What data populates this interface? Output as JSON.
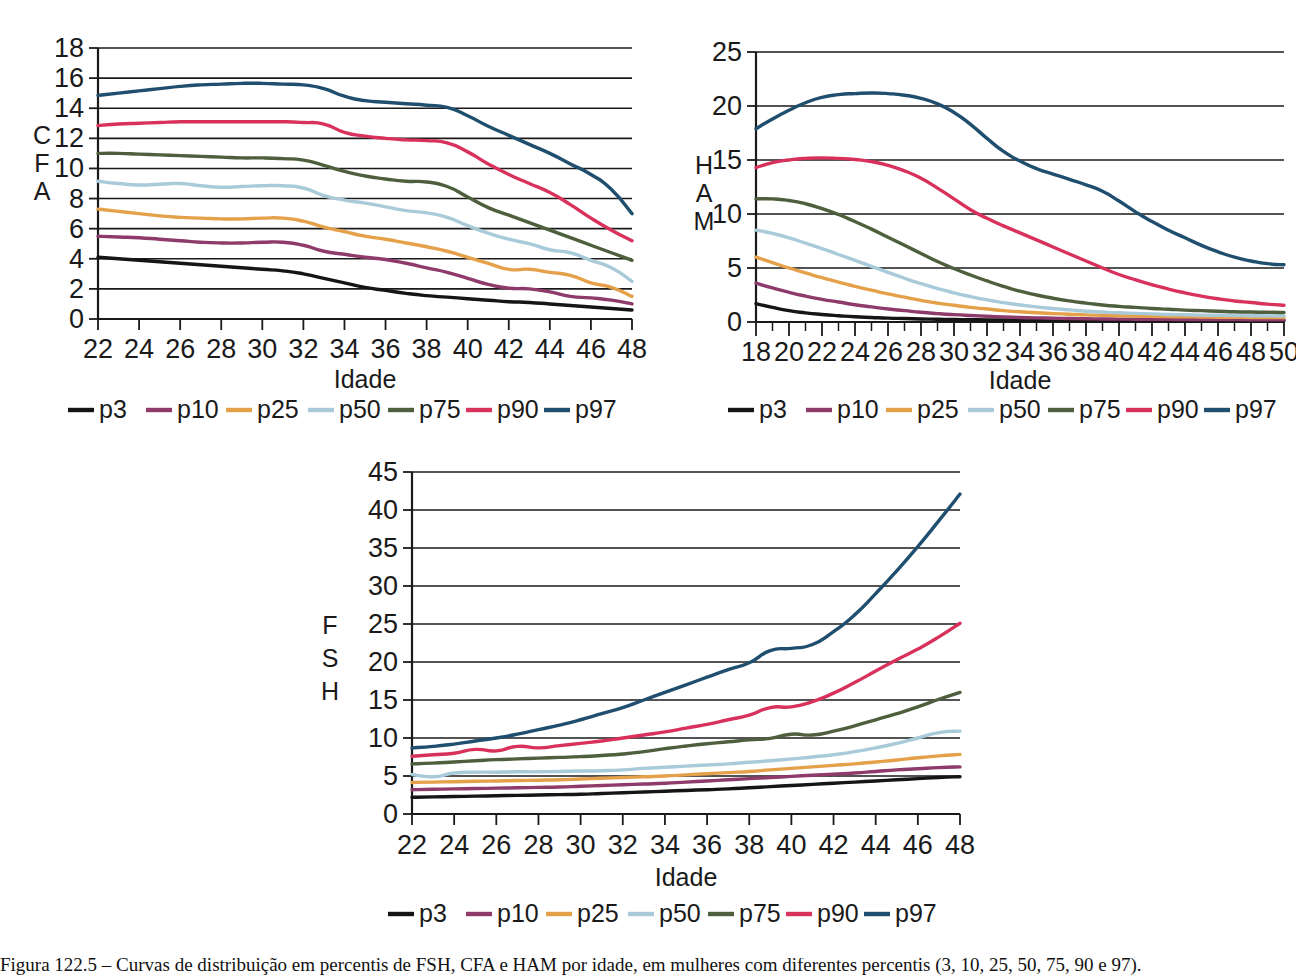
{
  "figure": {
    "caption": "Figura 122.5 – Curvas de distribuição em percentis de FSH, CFA e HAM por idade, em mulheres com diferentes percentis (3, 10, 25, 50, 75, 90 e 97).",
    "legend_labels": [
      "p3",
      "p10",
      "p25",
      "p50",
      "p75",
      "p90",
      "p97"
    ],
    "series_colors": {
      "p3": "#151515",
      "p10": "#8e3a6b",
      "p25": "#e5a04a",
      "p50": "#a9cbd9",
      "p75": "#4d5f3c",
      "p90": "#d8325c",
      "p97": "#1f4e6e"
    },
    "x_axis_title": "Idade"
  },
  "chart_data": [
    {
      "id": "cfa",
      "type": "line",
      "title": "",
      "ylabel": "CFA",
      "xlabel": "Idade",
      "ylabel_letters": [
        "C",
        "F",
        "A"
      ],
      "xlim": [
        22,
        48
      ],
      "ylim": [
        0,
        18
      ],
      "ytick_step": 2,
      "xtick_step": 2,
      "grid": true,
      "legend_position": "bottom",
      "yticks": [
        0,
        2,
        4,
        6,
        8,
        10,
        12,
        14,
        16,
        18
      ],
      "xticks": [
        22,
        24,
        26,
        28,
        30,
        32,
        34,
        36,
        38,
        40,
        42,
        44,
        46,
        48
      ],
      "x": [
        22,
        23,
        24,
        25,
        26,
        27,
        28,
        29,
        30,
        31,
        32,
        33,
        34,
        35,
        36,
        37,
        38,
        39,
        40,
        41,
        42,
        43,
        44,
        45,
        46,
        47,
        48
      ],
      "series": [
        {
          "name": "p3",
          "values": [
            4.1,
            4.0,
            3.9,
            3.8,
            3.7,
            3.6,
            3.5,
            3.4,
            3.3,
            3.2,
            3.0,
            2.7,
            2.4,
            2.1,
            1.9,
            1.7,
            1.55,
            1.45,
            1.35,
            1.25,
            1.15,
            1.1,
            1.0,
            0.9,
            0.8,
            0.7,
            0.6
          ]
        },
        {
          "name": "p10",
          "values": [
            5.5,
            5.45,
            5.4,
            5.3,
            5.2,
            5.1,
            5.05,
            5.05,
            5.1,
            5.1,
            4.9,
            4.5,
            4.3,
            4.1,
            3.95,
            3.7,
            3.4,
            3.1,
            2.7,
            2.3,
            2.05,
            2.0,
            1.8,
            1.5,
            1.4,
            1.25,
            1.0
          ]
        },
        {
          "name": "p25",
          "values": [
            7.3,
            7.15,
            7.0,
            6.85,
            6.75,
            6.7,
            6.65,
            6.65,
            6.7,
            6.7,
            6.5,
            6.1,
            5.8,
            5.5,
            5.3,
            5.05,
            4.8,
            4.5,
            4.1,
            3.7,
            3.3,
            3.3,
            3.1,
            2.9,
            2.4,
            2.1,
            1.5
          ]
        },
        {
          "name": "p50",
          "values": [
            9.15,
            9.0,
            8.9,
            8.95,
            9.0,
            8.85,
            8.75,
            8.8,
            8.85,
            8.85,
            8.7,
            8.2,
            7.9,
            7.7,
            7.45,
            7.2,
            7.05,
            6.75,
            6.2,
            5.7,
            5.3,
            5.0,
            4.6,
            4.4,
            3.9,
            3.4,
            2.5
          ]
        },
        {
          "name": "p75",
          "values": [
            11.0,
            11.0,
            10.95,
            10.9,
            10.85,
            10.8,
            10.75,
            10.7,
            10.7,
            10.65,
            10.55,
            10.2,
            9.8,
            9.5,
            9.3,
            9.15,
            9.1,
            8.8,
            8.1,
            7.4,
            6.9,
            6.4,
            5.9,
            5.4,
            4.9,
            4.4,
            3.9
          ]
        },
        {
          "name": "p90",
          "values": [
            12.85,
            12.95,
            13.0,
            13.05,
            13.1,
            13.1,
            13.1,
            13.1,
            13.1,
            13.1,
            13.05,
            12.95,
            12.4,
            12.15,
            12.0,
            11.9,
            11.85,
            11.7,
            11.1,
            10.3,
            9.6,
            9.0,
            8.4,
            7.6,
            6.7,
            5.9,
            5.2
          ]
        },
        {
          "name": "p97",
          "values": [
            14.85,
            15.0,
            15.15,
            15.3,
            15.45,
            15.55,
            15.6,
            15.65,
            15.65,
            15.6,
            15.55,
            15.3,
            14.8,
            14.5,
            14.4,
            14.3,
            14.2,
            14.05,
            13.5,
            12.8,
            12.2,
            11.6,
            11.0,
            10.3,
            9.6,
            8.6,
            7.0
          ]
        }
      ]
    },
    {
      "id": "ham",
      "type": "line",
      "title": "",
      "ylabel": "HAM",
      "xlabel": "Idade",
      "ylabel_letters": [
        "H",
        "A",
        "M"
      ],
      "xlim": [
        18,
        50
      ],
      "ylim": [
        0,
        25
      ],
      "ytick_step": 5,
      "xtick_step": 2,
      "grid": true,
      "legend_position": "bottom",
      "yticks": [
        0,
        5,
        10,
        15,
        20,
        25
      ],
      "xticks": [
        18,
        20,
        22,
        24,
        26,
        28,
        30,
        32,
        34,
        36,
        38,
        40,
        42,
        44,
        46,
        48,
        50
      ],
      "x": [
        18,
        19,
        20,
        21,
        22,
        23,
        24,
        25,
        26,
        27,
        28,
        29,
        30,
        31,
        32,
        33,
        34,
        35,
        36,
        37,
        38,
        39,
        40,
        41,
        42,
        43,
        44,
        45,
        46,
        47,
        48,
        49,
        50
      ],
      "series": [
        {
          "name": "p3",
          "values": [
            1.7,
            1.35,
            1.05,
            0.85,
            0.7,
            0.58,
            0.48,
            0.42,
            0.36,
            0.32,
            0.28,
            0.25,
            0.23,
            0.21,
            0.2,
            0.19,
            0.18,
            0.17,
            0.16,
            0.16,
            0.15,
            0.15,
            0.14,
            0.14,
            0.14,
            0.13,
            0.13,
            0.13,
            0.12,
            0.12,
            0.12,
            0.12,
            0.12
          ]
        },
        {
          "name": "p10",
          "values": [
            3.6,
            3.15,
            2.75,
            2.4,
            2.1,
            1.85,
            1.6,
            1.4,
            1.2,
            1.05,
            0.9,
            0.78,
            0.68,
            0.6,
            0.53,
            0.47,
            0.42,
            0.38,
            0.35,
            0.32,
            0.3,
            0.28,
            0.27,
            0.26,
            0.25,
            0.24,
            0.23,
            0.23,
            0.22,
            0.22,
            0.21,
            0.21,
            0.2
          ]
        },
        {
          "name": "p25",
          "values": [
            6.0,
            5.5,
            5.0,
            4.55,
            4.1,
            3.7,
            3.3,
            2.95,
            2.6,
            2.3,
            2.0,
            1.75,
            1.55,
            1.35,
            1.2,
            1.05,
            0.95,
            0.85,
            0.78,
            0.72,
            0.66,
            0.62,
            0.58,
            0.55,
            0.52,
            0.5,
            0.48,
            0.46,
            0.44,
            0.43,
            0.42,
            0.41,
            0.4
          ]
        },
        {
          "name": "p50",
          "values": [
            8.5,
            8.2,
            7.8,
            7.3,
            6.8,
            6.25,
            5.7,
            5.15,
            4.6,
            4.05,
            3.55,
            3.1,
            2.7,
            2.35,
            2.05,
            1.8,
            1.58,
            1.4,
            1.25,
            1.12,
            1.0,
            0.92,
            0.85,
            0.8,
            0.75,
            0.7,
            0.67,
            0.64,
            0.62,
            0.6,
            0.58,
            0.57,
            0.55
          ]
        },
        {
          "name": "p75",
          "values": [
            11.4,
            11.4,
            11.25,
            10.95,
            10.5,
            9.95,
            9.3,
            8.6,
            7.85,
            7.1,
            6.35,
            5.6,
            4.95,
            4.35,
            3.8,
            3.3,
            2.85,
            2.5,
            2.2,
            1.95,
            1.75,
            1.58,
            1.45,
            1.35,
            1.25,
            1.18,
            1.1,
            1.05,
            1.0,
            0.95,
            0.92,
            0.9,
            0.88
          ]
        },
        {
          "name": "p90",
          "values": [
            14.3,
            14.75,
            15.0,
            15.15,
            15.2,
            15.15,
            15.05,
            14.85,
            14.5,
            14.0,
            13.3,
            12.4,
            11.4,
            10.4,
            9.6,
            8.9,
            8.25,
            7.6,
            6.95,
            6.3,
            5.65,
            5.0,
            4.4,
            3.9,
            3.45,
            3.05,
            2.7,
            2.4,
            2.15,
            1.95,
            1.8,
            1.65,
            1.55
          ]
        },
        {
          "name": "p97",
          "values": [
            17.9,
            18.8,
            19.6,
            20.3,
            20.8,
            21.05,
            21.15,
            21.2,
            21.15,
            21.0,
            20.7,
            20.2,
            19.4,
            18.3,
            17.0,
            15.8,
            14.9,
            14.2,
            13.7,
            13.2,
            12.7,
            12.1,
            11.2,
            10.2,
            9.3,
            8.5,
            7.8,
            7.1,
            6.5,
            6.0,
            5.65,
            5.4,
            5.3
          ]
        }
      ]
    },
    {
      "id": "fsh",
      "type": "line",
      "title": "",
      "ylabel": "FSH",
      "xlabel": "Idade",
      "ylabel_letters": [
        "F",
        "S",
        "H"
      ],
      "xlim": [
        22,
        48
      ],
      "ylim": [
        0,
        45
      ],
      "ytick_step": 5,
      "xtick_step": 2,
      "grid": true,
      "legend_position": "bottom",
      "yticks": [
        0,
        5,
        10,
        15,
        20,
        25,
        30,
        35,
        40,
        45
      ],
      "xticks": [
        22,
        24,
        26,
        28,
        30,
        32,
        34,
        36,
        38,
        40,
        42,
        44,
        46,
        48
      ],
      "x": [
        22,
        23,
        24,
        25,
        26,
        27,
        28,
        29,
        30,
        31,
        32,
        33,
        34,
        35,
        36,
        37,
        38,
        39,
        40,
        41,
        42,
        43,
        44,
        45,
        46,
        47,
        48
      ],
      "series": [
        {
          "name": "p3",
          "values": [
            2.2,
            2.25,
            2.3,
            2.35,
            2.4,
            2.45,
            2.5,
            2.55,
            2.6,
            2.7,
            2.8,
            2.9,
            3.0,
            3.1,
            3.2,
            3.3,
            3.45,
            3.6,
            3.75,
            3.9,
            4.05,
            4.2,
            4.35,
            4.5,
            4.65,
            4.8,
            4.9
          ]
        },
        {
          "name": "p10",
          "values": [
            3.2,
            3.25,
            3.3,
            3.35,
            3.4,
            3.45,
            3.5,
            3.55,
            3.65,
            3.75,
            3.85,
            3.95,
            4.05,
            4.2,
            4.35,
            4.5,
            4.65,
            4.8,
            4.95,
            5.1,
            5.25,
            5.4,
            5.6,
            5.8,
            5.95,
            6.1,
            6.2
          ]
        },
        {
          "name": "p25",
          "values": [
            4.15,
            4.2,
            4.25,
            4.3,
            4.35,
            4.4,
            4.45,
            4.5,
            4.6,
            4.7,
            4.8,
            4.9,
            5.0,
            5.15,
            5.3,
            5.45,
            5.6,
            5.8,
            6.0,
            6.2,
            6.4,
            6.6,
            6.85,
            7.1,
            7.4,
            7.65,
            7.85
          ]
        },
        {
          "name": "p50",
          "values": [
            5.2,
            4.9,
            5.4,
            5.5,
            5.5,
            5.55,
            5.55,
            5.6,
            5.65,
            5.7,
            5.8,
            6.0,
            6.15,
            6.3,
            6.45,
            6.6,
            6.8,
            7.0,
            7.25,
            7.5,
            7.8,
            8.2,
            8.7,
            9.3,
            10.0,
            10.7,
            10.9
          ]
        },
        {
          "name": "p75",
          "values": [
            6.6,
            6.7,
            6.85,
            7.0,
            7.15,
            7.25,
            7.35,
            7.45,
            7.55,
            7.7,
            7.9,
            8.2,
            8.6,
            8.95,
            9.25,
            9.5,
            9.75,
            9.95,
            10.5,
            10.4,
            10.9,
            11.6,
            12.4,
            13.2,
            14.1,
            15.1,
            16.0
          ]
        },
        {
          "name": "p90",
          "values": [
            7.6,
            7.8,
            8.0,
            8.5,
            8.3,
            8.9,
            8.7,
            9.0,
            9.3,
            9.6,
            10.0,
            10.4,
            10.8,
            11.3,
            11.8,
            12.4,
            13.0,
            14.0,
            14.1,
            14.8,
            15.9,
            17.3,
            18.8,
            20.3,
            21.7,
            23.3,
            25.1
          ]
        },
        {
          "name": "p97",
          "values": [
            8.7,
            8.9,
            9.2,
            9.6,
            10.0,
            10.5,
            11.1,
            11.7,
            12.4,
            13.2,
            14.0,
            15.0,
            16.0,
            17.0,
            18.0,
            19.0,
            19.9,
            21.5,
            21.8,
            22.3,
            24.0,
            26.2,
            29.0,
            32.0,
            35.2,
            38.6,
            42.1
          ]
        }
      ]
    }
  ]
}
